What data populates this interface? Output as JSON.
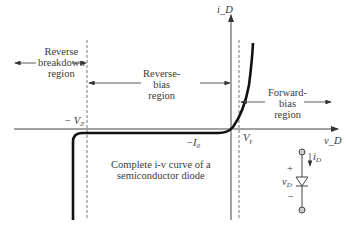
{
  "diagram": {
    "title": "Complete i-v curve of a semiconductor diode",
    "axes": {
      "y_label": "i_D",
      "x_label": "v_D"
    },
    "regions": [
      {
        "name": "reverse-breakdown",
        "lines": [
          "Reverse",
          "breakdown",
          "region"
        ]
      },
      {
        "name": "reverse-bias",
        "lines": [
          "Reverse-",
          "bias",
          "region"
        ]
      },
      {
        "name": "forward-bias",
        "lines": [
          "Forward-",
          "bias",
          "region"
        ]
      }
    ],
    "markers": {
      "breakdown_voltage": "− V",
      "breakdown_voltage_sub": "Z",
      "saturation_current": "−I",
      "saturation_current_sub": "0",
      "threshold_voltage": "V",
      "threshold_voltage_sub": "γ"
    },
    "caption_lines": [
      "Complete i-v curve of a",
      "semiconductor diode"
    ],
    "circuit": {
      "current_label": "i",
      "current_sub": "D",
      "voltage_label": "v",
      "voltage_sub": "D",
      "plus": "+",
      "minus": "−"
    }
  }
}
